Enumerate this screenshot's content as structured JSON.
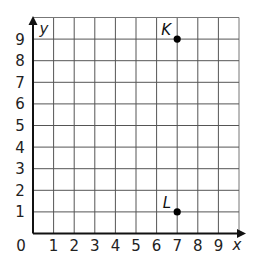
{
  "graph": {
    "x_axis": {
      "label": "x",
      "min": 0,
      "max": 10,
      "ticks": [
        "1",
        "2",
        "3",
        "4",
        "5",
        "6",
        "7",
        "8",
        "9"
      ],
      "origin_label": "0"
    },
    "y_axis": {
      "label": "y",
      "min": 0,
      "max": 10,
      "ticks": [
        "1",
        "2",
        "3",
        "4",
        "5",
        "6",
        "7",
        "8",
        "9"
      ]
    },
    "points": [
      {
        "label": "K",
        "x": 7,
        "y": 9
      },
      {
        "label": "L",
        "x": 7,
        "y": 1
      }
    ],
    "colors": {
      "grid": "#555555",
      "axis": "#111111",
      "point": "#000000"
    }
  },
  "chart_data": {
    "type": "scatter",
    "title": "",
    "xlabel": "x",
    "ylabel": "y",
    "xlim": [
      0,
      10
    ],
    "ylim": [
      0,
      10
    ],
    "grid": true,
    "x_ticks": [
      0,
      1,
      2,
      3,
      4,
      5,
      6,
      7,
      8,
      9
    ],
    "y_ticks": [
      1,
      2,
      3,
      4,
      5,
      6,
      7,
      8,
      9
    ],
    "series": [
      {
        "name": "points",
        "labels": [
          "K",
          "L"
        ],
        "x": [
          7,
          7
        ],
        "y": [
          9,
          1
        ]
      }
    ]
  }
}
